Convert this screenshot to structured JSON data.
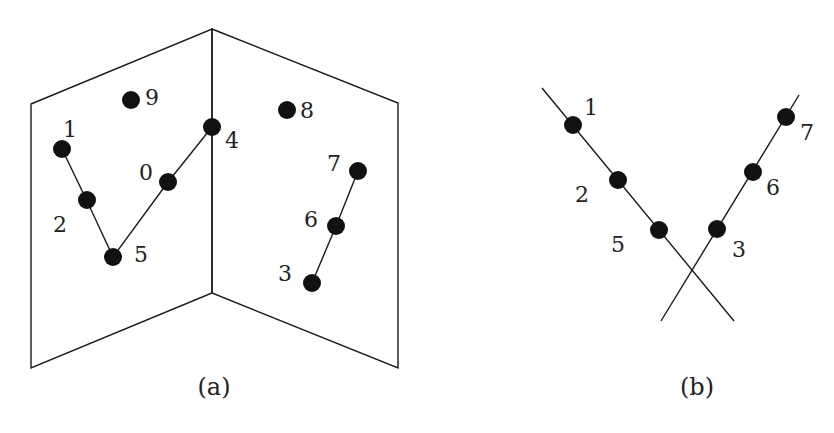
{
  "figure_a": {
    "caption": "(a)",
    "labels": {
      "p0": "0",
      "p1": "1",
      "p2": "2",
      "p3": "3",
      "p4": "4",
      "p5": "5",
      "p6": "6",
      "p7": "7",
      "p8": "8",
      "p9": "9"
    }
  },
  "figure_b": {
    "caption": "(b)",
    "labels": {
      "p1": "1",
      "p2": "2",
      "p5": "5",
      "p3": "3",
      "p6": "6",
      "p7": "7"
    }
  }
}
